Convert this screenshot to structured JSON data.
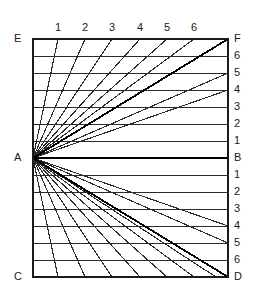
{
  "figure": {
    "type": "diagram",
    "colors": {
      "background": "#ffffff",
      "frame": "#1a1a1a",
      "gridline": "#2b2b2b",
      "ray": "#2b2b2b",
      "heavy": "#000000",
      "label": "#1a1a1a"
    },
    "frame": {
      "left": 33,
      "top": 39,
      "right": 228,
      "bottom": 277,
      "stroke_width": 2
    },
    "vanishing_point": {
      "name": "A",
      "x": 33,
      "y": 158
    },
    "grid": {
      "rows": 14,
      "row_height": 17,
      "interior_lines": 13,
      "stroke_width": 1
    },
    "corner_labels": [
      {
        "name": "E",
        "text": "E",
        "x": 14,
        "y": 33,
        "position": "top-left-outside"
      },
      {
        "name": "F",
        "text": "F",
        "x": 234,
        "y": 33,
        "position": "top-right-outside"
      },
      {
        "name": "A",
        "text": "A",
        "x": 14,
        "y": 152,
        "position": "left-middle-outside"
      },
      {
        "name": "B",
        "text": "B",
        "x": 234,
        "y": 152,
        "position": "right-middle-outside"
      },
      {
        "name": "C",
        "text": "C",
        "x": 14,
        "y": 271,
        "position": "bottom-left-outside"
      },
      {
        "name": "D",
        "text": "D",
        "x": 234,
        "y": 271,
        "position": "bottom-right-outside"
      }
    ],
    "right_scale_labels": [
      {
        "text": "6",
        "y": 56
      },
      {
        "text": "5",
        "y": 73
      },
      {
        "text": "4",
        "y": 90
      },
      {
        "text": "3",
        "y": 107
      },
      {
        "text": "2",
        "y": 124
      },
      {
        "text": "1",
        "y": 141
      },
      {
        "text": "1",
        "y": 175
      },
      {
        "text": "2",
        "y": 192
      },
      {
        "text": "3",
        "y": 209
      },
      {
        "text": "4",
        "y": 226
      },
      {
        "text": "5",
        "y": 243
      },
      {
        "text": "6",
        "y": 260
      }
    ],
    "top_scale_labels": [
      {
        "text": "1",
        "x": 58
      },
      {
        "text": "2",
        "x": 85
      },
      {
        "text": "3",
        "x": 112
      },
      {
        "text": "4",
        "x": 140
      },
      {
        "text": "5",
        "x": 167
      },
      {
        "text": "6",
        "x": 194
      }
    ],
    "horizontal_gridlines_y": [
      56,
      73,
      90,
      107,
      124,
      141,
      158,
      175,
      192,
      209,
      226,
      243,
      260
    ],
    "upper_fan_top_x": [
      58,
      85,
      112,
      140,
      167,
      194
    ],
    "lower_fan_bottom_x": [
      58,
      85,
      112,
      140,
      167,
      194,
      216
    ],
    "heavy_diagonals": [
      {
        "name": "A-F",
        "from": "A",
        "to": "F"
      },
      {
        "name": "A-D",
        "from": "A",
        "to": "D"
      }
    ],
    "extra_rays_right_edge_y": [
      73,
      90,
      226,
      243
    ]
  }
}
